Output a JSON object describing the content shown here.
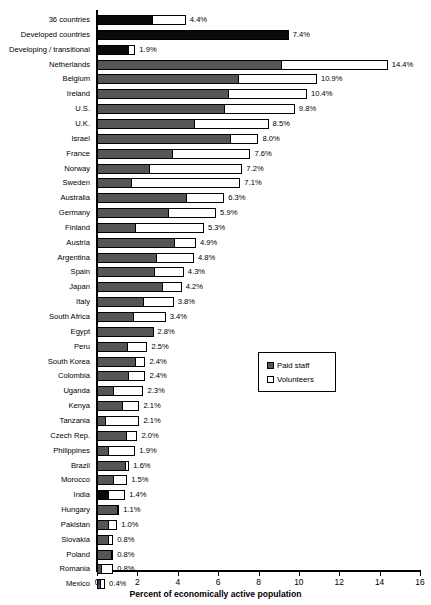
{
  "chart_data": {
    "type": "bar",
    "orientation": "horizontal",
    "stacked": true,
    "title": "",
    "xlabel": "Percent of economically active population",
    "ylabel": "",
    "xlim": [
      0,
      16
    ],
    "xticks": [
      0,
      2,
      4,
      6,
      8,
      10,
      12,
      14,
      16
    ],
    "grid": false,
    "legend": {
      "position": "middle-right",
      "entries": [
        {
          "name": "Paid staff",
          "color": "#555555"
        },
        {
          "name": "Volunteers",
          "color": "#ffffff"
        }
      ]
    },
    "series": [
      {
        "name": "Paid staff",
        "color": "#555555"
      },
      {
        "name": "Volunteers",
        "color": "#ffffff"
      }
    ],
    "categories": [
      "36 countries",
      "Developed countries",
      "Developing / transitional",
      "Netherlands",
      "Belgium",
      "Ireland",
      "U.S.",
      "U.K.",
      "Israel",
      "France",
      "Norway",
      "Sweden",
      "Australia",
      "Germany",
      "Finland",
      "Austria",
      "Argentina",
      "Spain",
      "Japan",
      "Italy",
      "South Africa",
      "Egypt",
      "Peru",
      "South Korea",
      "Colombia",
      "Uganda",
      "Kenya",
      "Tanzania",
      "Czech Rep.",
      "Philippines",
      "Brazil",
      "Morocco",
      "India",
      "Hungary",
      "Pakistan",
      "Slovakia",
      "Poland",
      "Romania",
      "Mexico"
    ],
    "rows": [
      {
        "category": "36 countries",
        "paid": 2.7,
        "volunteers": 1.7,
        "total": 4.4,
        "total_label": "4.4%",
        "style": "aggregate"
      },
      {
        "category": "Developed countries",
        "paid": 9.5,
        "volunteers": 0.0,
        "total": 7.4,
        "total_label": "7.4%",
        "style": "aggregate"
      },
      {
        "category": "Developing / transitional",
        "paid": 1.55,
        "volunteers": 0.35,
        "total": 1.9,
        "total_label": "1.9%",
        "style": "aggregate"
      },
      {
        "category": "Netherlands",
        "paid": 9.1,
        "volunteers": 5.3,
        "total": 14.4,
        "total_label": "14.4%",
        "style": "country"
      },
      {
        "category": "Belgium",
        "paid": 7.0,
        "volunteers": 3.9,
        "total": 10.9,
        "total_label": "10.9%",
        "style": "country"
      },
      {
        "category": "Ireland",
        "paid": 6.5,
        "volunteers": 3.9,
        "total": 10.4,
        "total_label": "10.4%",
        "style": "country"
      },
      {
        "category": "U.S.",
        "paid": 6.3,
        "volunteers": 3.5,
        "total": 9.8,
        "total_label": "9.8%",
        "style": "country"
      },
      {
        "category": "U.K.",
        "paid": 4.8,
        "volunteers": 3.7,
        "total": 8.5,
        "total_label": "8.5%",
        "style": "country"
      },
      {
        "category": "Israel",
        "paid": 6.6,
        "volunteers": 1.4,
        "total": 8.0,
        "total_label": "8.0%",
        "style": "country"
      },
      {
        "category": "France",
        "paid": 3.7,
        "volunteers": 3.9,
        "total": 7.6,
        "total_label": "7.6%",
        "style": "country"
      },
      {
        "category": "Norway",
        "paid": 2.6,
        "volunteers": 4.6,
        "total": 7.2,
        "total_label": "7.2%",
        "style": "country"
      },
      {
        "category": "Sweden",
        "paid": 1.7,
        "volunteers": 5.4,
        "total": 7.1,
        "total_label": "7.1%",
        "style": "country"
      },
      {
        "category": "Australia",
        "paid": 4.4,
        "volunteers": 1.9,
        "total": 6.3,
        "total_label": "6.3%",
        "style": "country"
      },
      {
        "category": "Germany",
        "paid": 3.5,
        "volunteers": 2.4,
        "total": 5.9,
        "total_label": "5.9%",
        "style": "country"
      },
      {
        "category": "Finland",
        "paid": 1.9,
        "volunteers": 3.4,
        "total": 5.3,
        "total_label": "5.3%",
        "style": "country"
      },
      {
        "category": "Austria",
        "paid": 3.8,
        "volunteers": 1.1,
        "total": 4.9,
        "total_label": "4.9%",
        "style": "country"
      },
      {
        "category": "Argentina",
        "paid": 2.9,
        "volunteers": 1.9,
        "total": 4.8,
        "total_label": "4.8%",
        "style": "country"
      },
      {
        "category": "Spain",
        "paid": 2.8,
        "volunteers": 1.5,
        "total": 4.3,
        "total_label": "4.3%",
        "style": "country"
      },
      {
        "category": "Japan",
        "paid": 3.2,
        "volunteers": 1.0,
        "total": 4.2,
        "total_label": "4.2%",
        "style": "country"
      },
      {
        "category": "Italy",
        "paid": 2.3,
        "volunteers": 1.5,
        "total": 3.8,
        "total_label": "3.8%",
        "style": "country"
      },
      {
        "category": "South Africa",
        "paid": 1.8,
        "volunteers": 1.6,
        "total": 3.4,
        "total_label": "3.4%",
        "style": "country"
      },
      {
        "category": "Egypt",
        "paid": 2.8,
        "volunteers": 0.0,
        "total": 2.8,
        "total_label": "2.8%",
        "style": "country"
      },
      {
        "category": "Peru",
        "paid": 1.5,
        "volunteers": 1.0,
        "total": 2.5,
        "total_label": "2.5%",
        "style": "country"
      },
      {
        "category": "South Korea",
        "paid": 1.9,
        "volunteers": 0.5,
        "total": 2.4,
        "total_label": "2.4%",
        "style": "country"
      },
      {
        "category": "Colombia",
        "paid": 1.55,
        "volunteers": 0.85,
        "total": 2.4,
        "total_label": "2.4%",
        "style": "country"
      },
      {
        "category": "Uganda",
        "paid": 0.8,
        "volunteers": 1.5,
        "total": 2.3,
        "total_label": "2.3%",
        "style": "country"
      },
      {
        "category": "Kenya",
        "paid": 1.25,
        "volunteers": 0.85,
        "total": 2.1,
        "total_label": "2.1%",
        "style": "country"
      },
      {
        "category": "Tanzania",
        "paid": 0.4,
        "volunteers": 1.7,
        "total": 2.1,
        "total_label": "2.1%",
        "style": "country"
      },
      {
        "category": "Czech Rep.",
        "paid": 1.45,
        "volunteers": 0.55,
        "total": 2.0,
        "total_label": "2.0%",
        "style": "country"
      },
      {
        "category": "Philippines",
        "paid": 0.55,
        "volunteers": 1.35,
        "total": 1.9,
        "total_label": "1.9%",
        "style": "country"
      },
      {
        "category": "Brazil",
        "paid": 1.4,
        "volunteers": 0.2,
        "total": 1.6,
        "total_label": "1.6%",
        "style": "country"
      },
      {
        "category": "Morocco",
        "paid": 0.8,
        "volunteers": 0.7,
        "total": 1.5,
        "total_label": "1.5%",
        "style": "country"
      },
      {
        "category": "India",
        "paid": 0.55,
        "volunteers": 0.85,
        "total": 1.4,
        "total_label": "1.4%",
        "style": "aggregate"
      },
      {
        "category": "Hungary",
        "paid": 1.0,
        "volunteers": 0.1,
        "total": 1.1,
        "total_label": "1.1%",
        "style": "country"
      },
      {
        "category": "Pakistan",
        "paid": 0.55,
        "volunteers": 0.45,
        "total": 1.0,
        "total_label": "1.0%",
        "style": "country"
      },
      {
        "category": "Slovakia",
        "paid": 0.55,
        "volunteers": 0.25,
        "total": 0.8,
        "total_label": "0.8%",
        "style": "country"
      },
      {
        "category": "Poland",
        "paid": 0.7,
        "volunteers": 0.1,
        "total": 0.8,
        "total_label": "0.8%",
        "style": "country"
      },
      {
        "category": "Romania",
        "paid": 0.2,
        "volunteers": 0.6,
        "total": 0.8,
        "total_label": "0.8%",
        "style": "country"
      },
      {
        "category": "Mexico",
        "paid": 0.15,
        "volunteers": 0.25,
        "total": 0.4,
        "total_label": "0.4%",
        "style": "country"
      }
    ]
  },
  "axis": {
    "tick_labels": [
      "0",
      "2",
      "4",
      "6",
      "8",
      "10",
      "12",
      "14",
      "16"
    ],
    "title": "Percent of economically active population"
  },
  "legend": {
    "paid_label": "Paid staff",
    "volunteers_label": "Volunteers"
  },
  "colors": {
    "paid": "#555555",
    "volunteers": "#ffffff",
    "aggregate_paid": "#0a0a0a",
    "outline": "#000000"
  }
}
